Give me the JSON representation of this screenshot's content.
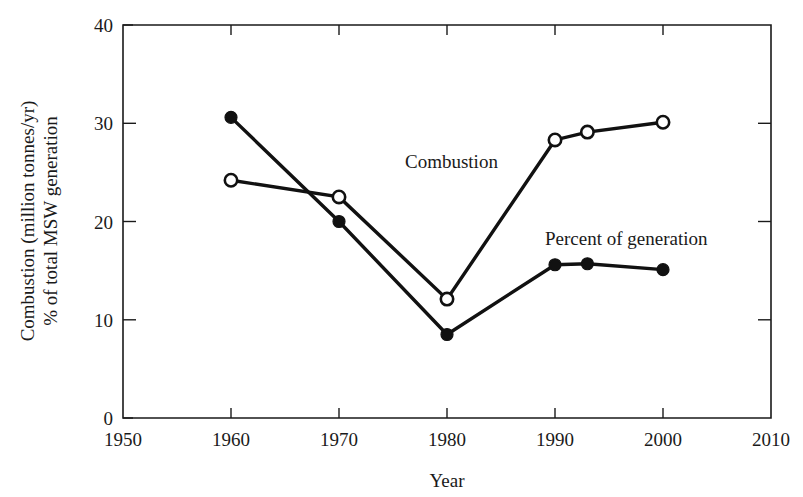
{
  "chart_data": {
    "type": "line",
    "title": "",
    "xlabel": "Year",
    "ylabel": "Combustion (million tonnes/yr)\n% of total MSW generation",
    "ylabel_line1": "Combustion (million tonnes/yr)",
    "ylabel_line2": "% of total MSW generation",
    "xlim": [
      1950,
      2010
    ],
    "ylim": [
      0,
      40
    ],
    "xticks": [
      1950,
      1960,
      1970,
      1980,
      1990,
      2000,
      2010
    ],
    "xtick_labels": [
      "1950",
      "1960",
      "1970",
      "1980",
      "1990",
      "2000",
      "2010"
    ],
    "yticks": [
      0,
      10,
      20,
      30,
      40
    ],
    "ytick_labels": [
      "0",
      "10",
      "20",
      "30",
      "40"
    ],
    "grid": false,
    "legend": "inline-annotations",
    "series": [
      {
        "name": "Combustion",
        "marker": "filled-circle",
        "annotation_label": "Combustion",
        "x": [
          1960,
          1970,
          1980,
          1990,
          1993,
          2000
        ],
        "values": [
          30.6,
          20.0,
          8.5,
          15.6,
          15.7,
          15.1
        ]
      },
      {
        "name": "Percent of generation",
        "marker": "open-circle",
        "annotation_label": "Percent of generation",
        "x": [
          1960,
          1970,
          1980,
          1990,
          1993,
          2000
        ],
        "values": [
          24.2,
          22.5,
          12.1,
          28.3,
          29.1,
          30.1
        ]
      }
    ],
    "annotations": [
      {
        "text": "Combustion",
        "x": 1976.5,
        "y": 25.9
      },
      {
        "text": "Percent of generation",
        "x": 1989.0,
        "y": 18.4
      }
    ]
  }
}
